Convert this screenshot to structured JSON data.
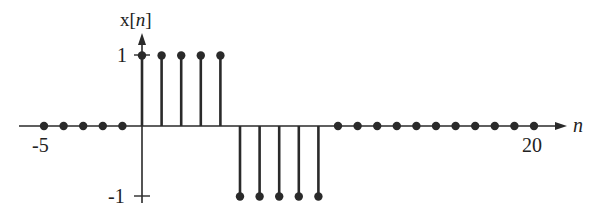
{
  "chart_data": {
    "type": "stem",
    "title": "",
    "xlabel": "n",
    "ylabel": "x[n]",
    "x": [
      -5,
      -4,
      -3,
      -2,
      -1,
      0,
      1,
      2,
      3,
      4,
      5,
      6,
      7,
      8,
      9,
      10,
      11,
      12,
      13,
      14,
      15,
      16,
      17,
      18,
      19,
      20
    ],
    "values": [
      0,
      0,
      0,
      0,
      0,
      1,
      1,
      1,
      1,
      1,
      -1,
      -1,
      -1,
      -1,
      -1,
      0,
      0,
      0,
      0,
      0,
      0,
      0,
      0,
      0,
      0,
      0
    ],
    "x_tick_labels": [
      {
        "value": -5,
        "label": "-5"
      },
      {
        "value": 20,
        "label": "20"
      }
    ],
    "y_tick_labels": [
      {
        "value": 1,
        "label": "1"
      },
      {
        "value": -1,
        "label": "-1"
      }
    ],
    "xlim": [
      -5,
      20
    ],
    "ylim": [
      -1,
      1
    ],
    "grid": false,
    "legend": null
  },
  "labels": {
    "y_axis_prefix": "x[",
    "y_axis_var": "n",
    "y_axis_suffix": "]",
    "x_axis_var": "n",
    "tick_neg5": "-5",
    "tick_20": "20",
    "tick_pos1": "1",
    "tick_neg1": "-1"
  },
  "style": {
    "ink": "#2a2a2a"
  }
}
